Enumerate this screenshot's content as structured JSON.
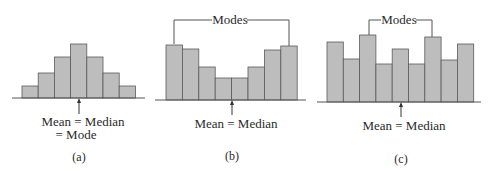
{
  "chart_data": [
    {
      "type": "bar",
      "panel": "(a)",
      "title": "",
      "values": [
        12,
        25,
        41,
        54,
        41,
        25,
        12
      ],
      "annotation": [
        "Mean = Median",
        "= Mode"
      ],
      "caption": "(a)",
      "grid": false
    },
    {
      "type": "bar",
      "panel": "(b)",
      "title": "",
      "values": [
        55,
        51,
        33,
        22,
        22,
        33,
        50,
        54
      ],
      "bracket_label": "Modes",
      "annotation": [
        "Mean = Median"
      ],
      "caption": "(b)",
      "grid": false
    },
    {
      "type": "bar",
      "panel": "(c)",
      "title": "",
      "values": [
        60,
        43,
        67,
        38,
        53,
        38,
        65,
        42,
        58
      ],
      "bracket_label": "Modes",
      "annotation": [
        "Mean = Median"
      ],
      "caption": "(c)",
      "grid": false
    }
  ],
  "labels": {
    "a_line1": "Mean = Median",
    "a_line2": "= Mode",
    "a_caption": "(a)",
    "b_modes": "Modes",
    "b_line1": "Mean = Median",
    "b_caption": "(b)",
    "c_modes": "Modes",
    "c_line1": "Mean = Median",
    "c_caption": "(c)"
  }
}
